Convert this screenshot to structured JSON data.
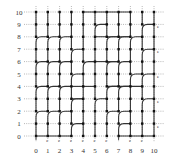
{
  "diagram": {
    "type": "lattice-path-diagram",
    "grid": {
      "cols": 11,
      "rows": 11,
      "origin_x": 36,
      "origin_y": 136,
      "dx": 11.8,
      "dy": 12.4,
      "dotted_color": "#9a9a9a",
      "path_color": "#333333",
      "dot_color": "#111111"
    },
    "x_labels": [
      "0",
      "1",
      "2",
      "3",
      "4",
      "5",
      "6",
      "7",
      "8",
      "9",
      "10"
    ],
    "y_labels": [
      "0",
      "1",
      "2",
      "3",
      "4",
      "5",
      "6",
      "7",
      "8",
      "9",
      "10"
    ],
    "right_markers_rows": [
      9,
      7,
      5,
      3,
      1
    ],
    "right_marker_glyph": "e",
    "bottom_markers_cols": [
      1,
      2,
      3,
      4,
      5,
      6,
      8,
      9
    ],
    "bottom_marker_glyph": "e",
    "bottom_ticks_cols": [
      0,
      7
    ],
    "verticals": [
      {
        "col": 0,
        "from": 0,
        "to": 10
      },
      {
        "col": 1,
        "from": 0,
        "to": 10
      },
      {
        "col": 2,
        "from": 0,
        "to": 10
      },
      {
        "col": 3,
        "from": 0,
        "to": 10
      },
      {
        "col": 4,
        "from": 0,
        "to": 10
      },
      {
        "col": 5,
        "from": 0,
        "to": 10
      },
      {
        "col": 6,
        "from": 0,
        "to": 10
      },
      {
        "col": 7,
        "from": 0,
        "to": 10
      },
      {
        "col": 8,
        "from": 0,
        "to": 10
      },
      {
        "col": 9,
        "from": 0,
        "to": 10
      },
      {
        "col": 10,
        "from": 0,
        "to": 10
      }
    ],
    "turns": [
      {
        "col": 0,
        "row": 8
      },
      {
        "col": 1,
        "row": 8
      },
      {
        "col": 2,
        "row": 8
      },
      {
        "col": 5,
        "row": 9
      },
      {
        "col": 6,
        "row": 8
      },
      {
        "col": 7,
        "row": 8
      },
      {
        "col": 8,
        "row": 8
      },
      {
        "col": 9,
        "row": 9
      },
      {
        "col": 0,
        "row": 6
      },
      {
        "col": 1,
        "row": 6
      },
      {
        "col": 2,
        "row": 6
      },
      {
        "col": 3,
        "row": 7
      },
      {
        "col": 6,
        "row": 6
      },
      {
        "col": 7,
        "row": 6
      },
      {
        "col": 9,
        "row": 7
      },
      {
        "col": 0,
        "row": 4
      },
      {
        "col": 1,
        "row": 4
      },
      {
        "col": 2,
        "row": 4
      },
      {
        "col": 3,
        "row": 5
      },
      {
        "col": 4,
        "row": 6
      },
      {
        "col": 6,
        "row": 4
      },
      {
        "col": 7,
        "row": 4
      },
      {
        "col": 8,
        "row": 5
      },
      {
        "col": 9,
        "row": 5
      },
      {
        "col": 0,
        "row": 2
      },
      {
        "col": 1,
        "row": 2
      },
      {
        "col": 2,
        "row": 2
      },
      {
        "col": 3,
        "row": 3
      },
      {
        "col": 5,
        "row": 3
      },
      {
        "col": 6,
        "row": 2
      },
      {
        "col": 7,
        "row": 2
      },
      {
        "col": 9,
        "row": 3
      },
      {
        "col": 1,
        "row": 0
      },
      {
        "col": 2,
        "row": 0
      },
      {
        "col": 3,
        "row": 1
      },
      {
        "col": 7,
        "row": 1
      },
      {
        "col": 8,
        "row": 0
      },
      {
        "col": 9,
        "row": 0
      }
    ],
    "horizontals": [
      {
        "row": 10,
        "from": 4,
        "to": 8
      },
      {
        "row": 8,
        "from": 5,
        "to": 8
      },
      {
        "row": 6,
        "from": 5,
        "to": 7
      },
      {
        "row": 4,
        "from": 3,
        "to": 5
      },
      {
        "row": 4,
        "from": 6,
        "to": 9
      },
      {
        "row": 3,
        "from": 3,
        "to": 4
      },
      {
        "row": 0,
        "from": 0,
        "to": 3
      },
      {
        "row": 0,
        "from": 7,
        "to": 10
      }
    ]
  }
}
